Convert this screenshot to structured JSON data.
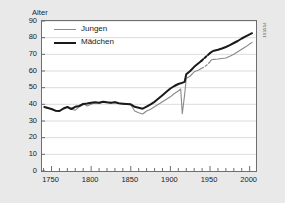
{
  "figure": {
    "side_code": "103554",
    "background_color": "#e9e9e9",
    "plot_background_color": "#ffffff",
    "frame_color": "#6e6e6e"
  },
  "legend": {
    "position": "top-left-inside",
    "entries": [
      {
        "label": "Jungen",
        "color": "#8a8a8a",
        "width": 1.1,
        "style": "solid"
      },
      {
        "label": "Mädchen",
        "color": "#1a1a1a",
        "width": 2.0,
        "style": "solid"
      }
    ]
  },
  "chart_data": {
    "type": "line",
    "title": "",
    "subtitle": "",
    "xlabel": "",
    "ylabel": "Alter",
    "xlim": [
      1738,
      2008
    ],
    "ylim": [
      0,
      90
    ],
    "grid": "horizontal",
    "x_ticks": [
      1750,
      1800,
      1850,
      1900,
      1950,
      2000
    ],
    "x_tick_labels": [
      "1750",
      "1800",
      "1850",
      "1900",
      "1950",
      "2000"
    ],
    "x_minor_tick_step": 10,
    "y_ticks": [
      0,
      10,
      20,
      30,
      40,
      50,
      60,
      70,
      80,
      90
    ],
    "y_tick_labels": [
      "0",
      "10",
      "20",
      "30",
      "40",
      "50",
      "60",
      "70",
      "80",
      "90"
    ],
    "annotations": [
      "Gray line (Jungen) collapses to about 34 years around 1915 during World War I",
      "Both series are drawn dashed across the 1939-1949 World War II data gap"
    ],
    "series": [
      {
        "name": "Jungen",
        "color": "#8a8a8a",
        "width": 1.1,
        "x": [
          1741,
          1750,
          1755,
          1760,
          1765,
          1770,
          1775,
          1780,
          1785,
          1790,
          1795,
          1800,
          1805,
          1810,
          1815,
          1820,
          1825,
          1830,
          1835,
          1840,
          1845,
          1850,
          1855,
          1860,
          1865,
          1870,
          1875,
          1880,
          1885,
          1890,
          1895,
          1900,
          1905,
          1910,
          1913,
          1915,
          1918,
          1920,
          1925,
          1930,
          1935,
          1939
        ],
        "y": [
          38.2,
          37.0,
          36.0,
          35.8,
          37.2,
          38.5,
          37.0,
          36.5,
          38.5,
          40.5,
          39.0,
          40.0,
          41.0,
          40.5,
          41.2,
          41.0,
          40.6,
          41.5,
          40.5,
          40.2,
          40.0,
          39.8,
          36.0,
          35.0,
          34.2,
          36.0,
          37.0,
          38.5,
          40.0,
          41.5,
          43.0,
          44.5,
          46.5,
          48.0,
          49.2,
          34.4,
          46.0,
          55.5,
          57.0,
          59.5,
          60.5,
          61.5
        ],
        "dashed_x": [
          1939,
          1943,
          1947,
          1949
        ],
        "dashed_y": [
          61.5,
          62.5,
          64.0,
          65.0
        ]
      },
      {
        "name": "Jungen (post-war)",
        "color": "#8a8a8a",
        "width": 1.1,
        "continues": "Jungen",
        "x": [
          1949,
          1952,
          1955,
          1960,
          1965,
          1970,
          1975,
          1980,
          1985,
          1990,
          1995,
          2000,
          2003
        ],
        "y": [
          65.0,
          66.8,
          67.0,
          67.2,
          67.5,
          67.8,
          68.8,
          70.0,
          71.5,
          73.0,
          74.5,
          76.2,
          77.2
        ]
      },
      {
        "name": "Mädchen",
        "color": "#1a1a1a",
        "width": 2.0,
        "x": [
          1741,
          1750,
          1755,
          1760,
          1765,
          1770,
          1775,
          1780,
          1785,
          1790,
          1795,
          1800,
          1805,
          1810,
          1815,
          1820,
          1825,
          1830,
          1835,
          1840,
          1845,
          1850,
          1855,
          1860,
          1865,
          1870,
          1875,
          1880,
          1885,
          1890,
          1895,
          1900,
          1905,
          1910,
          1913,
          1918,
          1920,
          1925,
          1930,
          1935,
          1939
        ],
        "y": [
          38.4,
          37.2,
          36.2,
          36.0,
          37.5,
          38.4,
          37.2,
          38.5,
          39.0,
          40.2,
          40.5,
          41.0,
          41.2,
          41.0,
          41.5,
          41.2,
          41.0,
          41.2,
          40.6,
          40.4,
          40.2,
          40.0,
          38.5,
          38.0,
          37.4,
          38.6,
          40.0,
          41.5,
          43.5,
          45.5,
          47.5,
          49.5,
          51.0,
          52.2,
          52.6,
          53.5,
          58.0,
          60.0,
          62.5,
          64.5,
          66.0
        ],
        "dashed_x": [
          1939,
          1943,
          1947,
          1950
        ],
        "dashed_y": [
          66.0,
          67.8,
          69.5,
          70.8
        ]
      },
      {
        "name": "Mädchen (post-war)",
        "color": "#1a1a1a",
        "width": 2.0,
        "continues": "Mädchen",
        "x": [
          1950,
          1953,
          1955,
          1960,
          1965,
          1970,
          1975,
          1980,
          1985,
          1990,
          1995,
          2000,
          2003
        ],
        "y": [
          70.8,
          71.8,
          72.2,
          72.8,
          73.5,
          74.4,
          75.5,
          76.8,
          78.0,
          79.5,
          80.8,
          82.0,
          82.7
        ]
      }
    ]
  }
}
